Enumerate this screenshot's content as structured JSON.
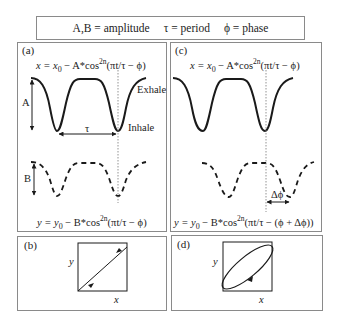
{
  "legend": {
    "items": [
      "A,B = amplitude",
      "τ = period",
      "ϕ = phase"
    ]
  },
  "panels": {
    "a": {
      "label": "(a)",
      "eq_top": {
        "lhs": "x = x",
        "sub": "0",
        "mid": " − A*cos",
        "sup": "2n",
        "rhs": "(πt/τ − ϕ)"
      },
      "eq_bottom": {
        "lhs": "y = y",
        "sub": "0",
        "mid": " − B*cos",
        "sup": "2n",
        "rhs": "(πt/τ − ϕ)"
      },
      "labels": {
        "exhale": "Exhale",
        "inhale": "Inhale",
        "A": "A",
        "B": "B",
        "tau": "τ"
      }
    },
    "b": {
      "label": "(b)",
      "x_axis": "x",
      "y_axis": "y"
    },
    "c": {
      "label": "(c)",
      "eq_top": {
        "lhs": "x = x",
        "sub": "0",
        "mid": " − A*cos",
        "sup": "2n",
        "rhs": "(πt/τ − ϕ)"
      },
      "eq_bottom": {
        "lhs": "y = y",
        "sub": "0",
        "mid": " − B*cos",
        "sup": "2n",
        "rhs": "(πt/τ − (ϕ + Δϕ))"
      },
      "labels": {
        "delta_phi": "Δϕ"
      }
    },
    "d": {
      "label": "(d)",
      "x_axis": "x",
      "y_axis": "y"
    }
  },
  "colors": {
    "curve": "#1a1a1a",
    "frame": "#8a8a8a",
    "guide": "#777777"
  }
}
